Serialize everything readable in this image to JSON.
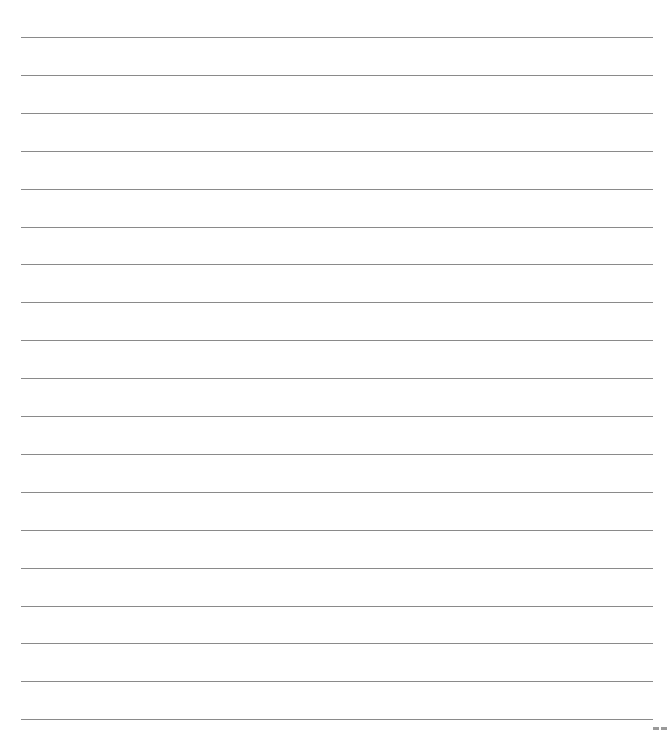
{
  "page": {
    "type": "lined-paper",
    "line_count": 19,
    "line_color": "#8a8a8a",
    "background_color": "#ffffff",
    "first_line_y": 37,
    "line_spacing": 37.9,
    "line_left": 21,
    "line_right": 653
  },
  "footer": {
    "corner_mark": ""
  }
}
